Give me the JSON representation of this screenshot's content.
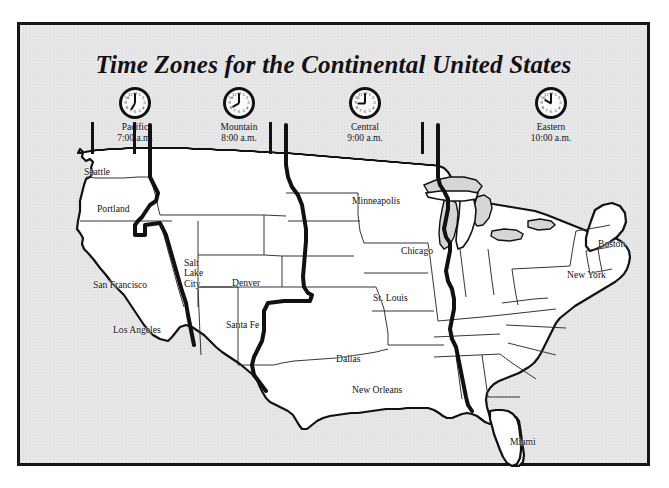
{
  "poster": {
    "title": "Time Zones for the Continental United States",
    "background_color": "#e2e2e2",
    "frame_color": "#16161a",
    "land_color": "#ffffff",
    "ocean_color": "#d6d6d6",
    "boundary_color": "#111114"
  },
  "zones": [
    {
      "name": "Pacific",
      "time": "7:00 a.m.",
      "clock_hour": 7,
      "clock_minute": 0
    },
    {
      "name": "Mountain",
      "time": "8:00 a.m.",
      "clock_hour": 8,
      "clock_minute": 0
    },
    {
      "name": "Central",
      "time": "9:00 a.m.",
      "clock_hour": 9,
      "clock_minute": 0
    },
    {
      "name": "Eastern",
      "time": "10:00 a.m.",
      "clock_hour": 10,
      "clock_minute": 0
    }
  ],
  "clock_numerals": [
    "12",
    "1",
    "2",
    "3",
    "4",
    "5",
    "6",
    "7",
    "8",
    "9",
    "10",
    "11"
  ],
  "cities": [
    {
      "name": "Seattle",
      "zone": "Pacific"
    },
    {
      "name": "Portland",
      "zone": "Pacific"
    },
    {
      "name": "San Francisco",
      "zone": "Pacific"
    },
    {
      "name": "Los Angeles",
      "zone": "Pacific"
    },
    {
      "name": "Salt Lake City",
      "zone": "Mountain"
    },
    {
      "name": "Denver",
      "zone": "Mountain"
    },
    {
      "name": "Santa Fe",
      "zone": "Mountain"
    },
    {
      "name": "Minneapolis",
      "zone": "Central"
    },
    {
      "name": "Chicago",
      "zone": "Central"
    },
    {
      "name": "St. Louis",
      "zone": "Central"
    },
    {
      "name": "Dallas",
      "zone": "Central"
    },
    {
      "name": "New Orleans",
      "zone": "Central"
    },
    {
      "name": "Boston",
      "zone": "Eastern"
    },
    {
      "name": "New York",
      "zone": "Eastern"
    },
    {
      "name": "Miami",
      "zone": "Eastern"
    }
  ],
  "city_labels": {
    "seattle": "Seattle",
    "portland": "Portland",
    "san_francisco": "San Francisco",
    "los_angeles": "Los Angeles",
    "salt_lake_city_l1": "Salt",
    "salt_lake_city_l2": "Lake",
    "salt_lake_city_l3": "City",
    "denver": "Denver",
    "santa_fe": "Santa Fe",
    "minneapolis": "Minneapolis",
    "chicago": "Chicago",
    "st_louis": "St. Louis",
    "dallas": "Dallas",
    "new_orleans": "New Orleans",
    "boston": "Boston",
    "new_york": "New York",
    "miami": "Miami"
  }
}
